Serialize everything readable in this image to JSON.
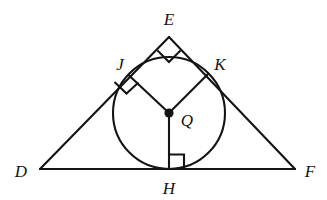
{
  "figure": {
    "type": "geometry-diagram",
    "background_color": "#ffffff",
    "stroke_color": "#141414",
    "labels": {
      "apex": "E",
      "left_tangent": "J",
      "right_tangent": "K",
      "center": "Q",
      "bottom_tangent": "H",
      "left_vertex": "D",
      "right_vertex": "F"
    },
    "points": {
      "D": {
        "x": 40,
        "y": 169
      },
      "E": {
        "x": 169,
        "y": 37
      },
      "F": {
        "x": 295,
        "y": 169
      },
      "Q": {
        "x": 169,
        "y": 113
      },
      "J": {
        "x": 128.5,
        "y": 75
      },
      "K": {
        "x": 208,
        "y": 74
      },
      "H": {
        "x": 169,
        "y": 169
      }
    },
    "label_positions": {
      "E": {
        "x": 169,
        "y": 21
      },
      "J": {
        "x": 120,
        "y": 66
      },
      "K": {
        "x": 219,
        "y": 66
      },
      "Q": {
        "x": 186,
        "y": 124
      },
      "H": {
        "x": 169,
        "y": 193
      },
      "D": {
        "x": 22,
        "y": 177
      },
      "F": {
        "x": 310,
        "y": 177
      }
    },
    "circle": {
      "cx": 169,
      "cy": 113,
      "r": 56
    },
    "segments": [
      {
        "name": "side-DE",
        "from": "D",
        "to": "E"
      },
      {
        "name": "side-EF",
        "from": "E",
        "to": "F"
      },
      {
        "name": "side-DF",
        "from": "D",
        "to": "F"
      },
      {
        "name": "radius-QJ",
        "from": "Q",
        "to": "J"
      },
      {
        "name": "radius-QK",
        "from": "Q",
        "to": "K"
      },
      {
        "name": "radius-QH",
        "from": "Q",
        "to": "H"
      }
    ],
    "right_angle_marks": [
      {
        "name": "right-angle-at-E",
        "vertex": "E"
      },
      {
        "name": "right-angle-at-J",
        "vertex": "J"
      },
      {
        "name": "right-angle-at-H",
        "vertex": "H"
      }
    ],
    "center_dot": {
      "radius": 4.5,
      "filled": true
    }
  }
}
